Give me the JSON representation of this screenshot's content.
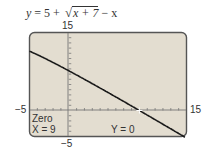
{
  "chart_data": {
    "type": "line",
    "function": "y = 5 + sqrt(x + 7) - x",
    "xlim": [
      -5,
      15
    ],
    "ylim": [
      -5,
      15
    ],
    "x_tick_labels": [
      "-5",
      "15"
    ],
    "y_tick_labels": [
      "15",
      "-5"
    ],
    "grid": false,
    "series": [
      {
        "name": "y = 5 + √(x+7) − x",
        "x": [
          -5,
          -3,
          -1,
          1,
          3,
          5,
          7,
          9,
          11,
          13,
          14.5
        ],
        "y": [
          11.41,
          10.0,
          8.41,
          6.83,
          5.16,
          3.46,
          1.74,
          0.0,
          -1.76,
          -3.53,
          -4.8
        ]
      }
    ],
    "annotation": {
      "label": "Zero",
      "x_readout": "X = 9",
      "y_readout": "Y = 0",
      "point": [
        9,
        0
      ]
    }
  },
  "equation": {
    "lhs": "y",
    "eq": " = 5 + ",
    "radicand": "x + 7",
    "tail": " − x"
  },
  "axis_labels": {
    "y_max": "15",
    "y_min": "−5",
    "x_min": "−5",
    "x_max": "15"
  },
  "screen": {
    "zero_label": "Zero",
    "x_readout": "X = 9",
    "y_readout": "Y = 0",
    "bg_color": "#e3ddd0",
    "frame_color": "#555555",
    "curve_color": "#1a1a1a"
  }
}
